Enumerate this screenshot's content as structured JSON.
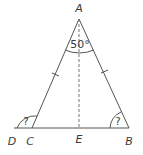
{
  "diagram": {
    "type": "isosceles-triangle",
    "points": {
      "A": {
        "label": "A"
      },
      "B": {
        "label": "B"
      },
      "C": {
        "label": "C"
      },
      "D": {
        "label": "D"
      },
      "E": {
        "label": "E"
      }
    },
    "angles": {
      "apex": {
        "vertex": "A",
        "value": "50°"
      },
      "exterior_C": {
        "vertex": "C",
        "value": "?"
      },
      "base_B": {
        "vertex": "B",
        "value": "?"
      }
    },
    "equal_sides": [
      "AC",
      "AB"
    ],
    "altitude": {
      "from": "A",
      "to": "E",
      "style": "dashed"
    },
    "colors": {
      "line": "#555555",
      "text": "#3a3a3a",
      "background": "#ffffff"
    }
  }
}
